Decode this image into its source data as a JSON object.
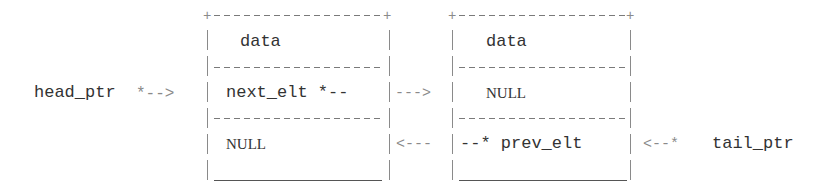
{
  "diagram": {
    "type": "doubly-linked-list",
    "nodes": [
      {
        "id": "node-1",
        "fields": {
          "data": "data",
          "next": "next_elt *--",
          "prev": "NULL"
        }
      },
      {
        "id": "node-2",
        "fields": {
          "data": "data",
          "next": "NULL",
          "prev": "--* prev_elt"
        }
      }
    ],
    "pointers": {
      "head": "head_ptr",
      "head_arrow": "*-->",
      "tail": "tail_ptr",
      "tail_arrow": "<--*"
    },
    "links": {
      "forward_arrow": "--->",
      "backward_arrow": "<---"
    }
  }
}
